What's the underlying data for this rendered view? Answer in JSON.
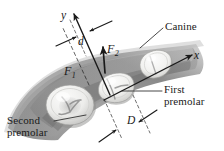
{
  "figure": {
    "background_color": "#ffffff",
    "ink_color": "#1a1a1a",
    "width": 224,
    "height": 151
  },
  "axes": {
    "y_label": "y",
    "x_label": "x",
    "origin_note": "axes intersect near first premolar"
  },
  "forces": [
    {
      "name": "F1",
      "base": "F",
      "sub": "1"
    },
    {
      "name": "F2",
      "base": "F",
      "sub": "2"
    }
  ],
  "dimensions": [
    {
      "name": "d",
      "label": "d"
    },
    {
      "name": "D",
      "label": "D"
    }
  ],
  "callouts": [
    {
      "name": "canine",
      "lines": [
        "Canine"
      ]
    },
    {
      "name": "first-premolar",
      "lines": [
        "First",
        "premolar"
      ]
    },
    {
      "name": "second-premolar",
      "lines": [
        "Second",
        "premolar"
      ]
    }
  ],
  "teeth": [
    {
      "name": "second-premolar-tooth",
      "shape": "molar-round"
    },
    {
      "name": "first-premolar-tooth",
      "shape": "premolar-square"
    },
    {
      "name": "canine-tooth",
      "shape": "canine-pear"
    }
  ],
  "colors": {
    "gum_dark": "#6e6e6e",
    "gum_mid": "#9a9a9a",
    "gum_light": "#c9c9c9",
    "enamel_light": "#f2f2f0",
    "enamel_shadow": "#b8b8b6",
    "fissure": "#7d7d7d",
    "ink": "#1a1a1a"
  }
}
